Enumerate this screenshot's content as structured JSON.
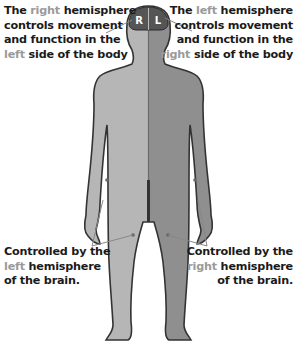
{
  "diagram": {
    "head_labels": {
      "right": "R",
      "left": "L"
    },
    "top_left": {
      "line1_pre": "The ",
      "line1_hl": "right",
      "line1_post": " hemisphere",
      "line2": "controls movement",
      "line3": "and function in the",
      "line4_hl": "left",
      "line4_post": " side of the body"
    },
    "top_right": {
      "line1_pre": "The ",
      "line1_hl": "left",
      "line1_post": " hemisphere",
      "line2": "controls movement",
      "line3": "and function in the",
      "line4_hl": "right",
      "line4_post": " side of the body"
    },
    "bottom_left": {
      "line1": "Controlled by the",
      "line2_hl": "left",
      "line2_post": " hemisphere",
      "line3": "of the brain."
    },
    "bottom_right": {
      "line1": "Controlled by the",
      "line2_hl": "right",
      "line2_post": " hemisphere",
      "line3": "of the brain."
    },
    "colors": {
      "body_viewer_right_side": "#b4b4b4",
      "body_viewer_left_side": "#8e8e8e",
      "brain": "#555555",
      "outline": "#333333",
      "highlight_text": "#9a9a9a",
      "pointer_line": "#888888"
    }
  }
}
